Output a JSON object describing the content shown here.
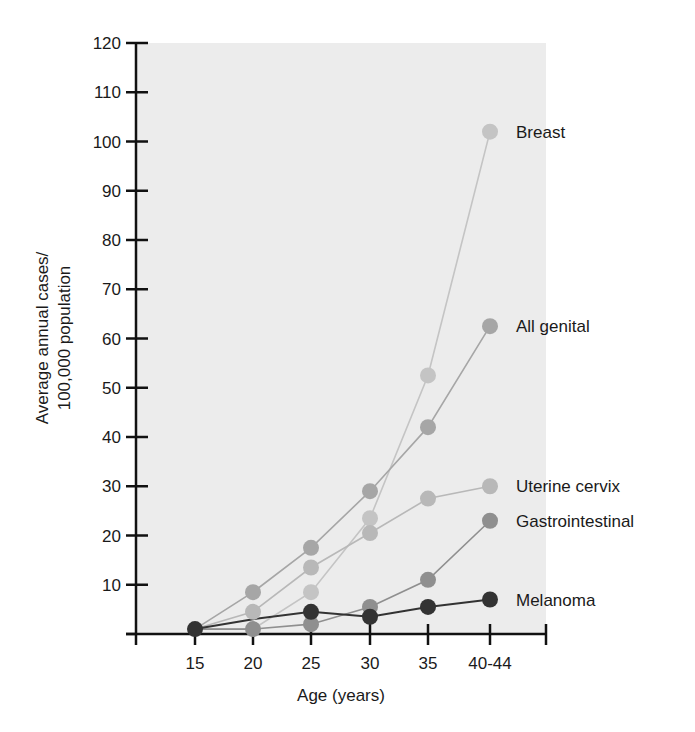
{
  "chart_data": {
    "type": "line",
    "title": "",
    "xlabel": "Age (years)",
    "ylabel": "Average annual cases/\n100,000 population",
    "ylabel_lines": [
      "Average annual cases/",
      "100,000 population"
    ],
    "categories": [
      "15",
      "20",
      "25",
      "30",
      "35",
      "40-44"
    ],
    "ylim": [
      0,
      120
    ],
    "yticks": [
      10,
      20,
      30,
      40,
      50,
      60,
      70,
      80,
      90,
      100,
      110,
      120
    ],
    "grid": false,
    "legend_position": "inline-right",
    "plot_background": "#ececec",
    "series": [
      {
        "name": "Breast",
        "color": "#c4c4c4",
        "values": [
          1,
          1,
          8.5,
          23.5,
          52.5,
          102
        ]
      },
      {
        "name": "All genital",
        "color": "#a6a6a6",
        "values": [
          1,
          8.5,
          17.5,
          29,
          42,
          62.5
        ]
      },
      {
        "name": "Uterine cervix",
        "color": "#b8b8b8",
        "values": [
          1,
          4.5,
          13.5,
          20.5,
          27.5,
          30
        ]
      },
      {
        "name": "Gastrointestinal",
        "color": "#8f8f8f",
        "values": [
          1,
          1,
          2,
          5.5,
          11,
          23
        ]
      },
      {
        "name": "Melanoma",
        "color": "#333333",
        "values": [
          1,
          3,
          4.5,
          3.5,
          5.5,
          7
        ]
      }
    ]
  }
}
